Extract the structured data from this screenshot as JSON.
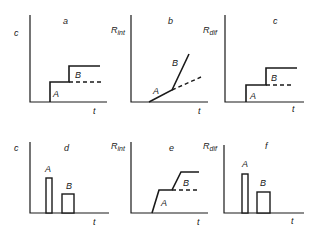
{
  "figure": {
    "panels": [
      {
        "id": "a",
        "label": "a",
        "y_label": "c",
        "x_label": "t",
        "curve": "step",
        "peak_labels": [
          "A",
          "B"
        ]
      },
      {
        "id": "b",
        "label": "b",
        "y_label": "R",
        "y_label_sub": "int",
        "x_label": "t",
        "curve": "ramp",
        "peak_labels": [
          "A",
          "B"
        ]
      },
      {
        "id": "c",
        "label": "c",
        "y_label": "R",
        "y_label_sub": "dif",
        "x_label": "t",
        "curve": "step",
        "peak_labels": [
          "A",
          "B"
        ]
      },
      {
        "id": "d",
        "label": "d",
        "y_label": "c",
        "x_label": "t",
        "curve": "pulse",
        "peak_labels": [
          "A",
          "B"
        ]
      },
      {
        "id": "e",
        "label": "e",
        "y_label": "R",
        "y_label_sub": "int",
        "x_label": "t",
        "curve": "sloped-step",
        "peak_labels": [
          "A",
          "B"
        ]
      },
      {
        "id": "f",
        "label": "f",
        "y_label": "R",
        "y_label_sub": "dif",
        "x_label": "t",
        "curve": "pulse",
        "peak_labels": [
          "A",
          "B"
        ]
      }
    ]
  },
  "colors": {
    "ink": "#1a1a1a",
    "background": "#ffffff"
  }
}
